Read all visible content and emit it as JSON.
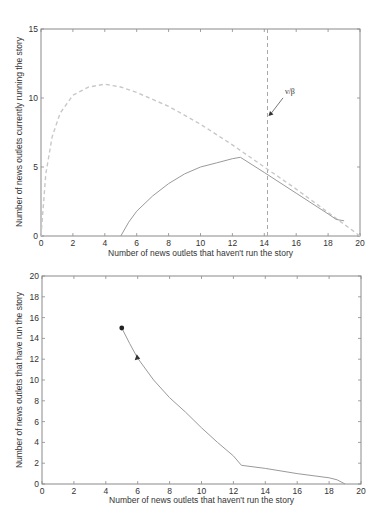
{
  "chart_data": [
    {
      "type": "line",
      "title": "",
      "xlabel": "Number of news outlets that haven't run the story",
      "ylabel": "Number of news outlets currently running the story",
      "xlim": [
        0,
        20
      ],
      "ylim": [
        0,
        15
      ],
      "xticks": [
        "0",
        "2",
        "4",
        "6",
        "8",
        "10",
        "12",
        "14",
        "16",
        "18",
        "20"
      ],
      "yticks": [
        "0",
        "5",
        "10",
        "15"
      ],
      "grid": false,
      "series": [
        {
          "name": "trajectory",
          "style": "solid",
          "x": [
            5.0,
            5.5,
            6.0,
            7.0,
            8.0,
            9.0,
            10.0,
            11.0,
            12.0,
            12.5,
            14.0,
            16.0,
            18.0,
            18.5,
            19.0
          ],
          "y": [
            0.0,
            1.0,
            1.8,
            2.9,
            3.8,
            4.5,
            5.0,
            5.3,
            5.6,
            5.7,
            4.6,
            3.1,
            1.6,
            1.2,
            1.1
          ]
        },
        {
          "name": "nullcline",
          "style": "dashed",
          "x": [
            0.0,
            0.3,
            0.7,
            1.2,
            2.0,
            3.0,
            4.0,
            5.0,
            6.0,
            8.0,
            10.0,
            12.0,
            14.0,
            16.0,
            18.0,
            20.0
          ],
          "y": [
            0.0,
            4.5,
            7.2,
            8.9,
            10.2,
            10.8,
            11.0,
            10.8,
            10.4,
            9.4,
            8.1,
            6.6,
            5.0,
            3.4,
            1.7,
            0.0
          ]
        },
        {
          "name": "nu/beta",
          "style": "dashed-vertical",
          "x": [
            14.2,
            14.2
          ],
          "y": [
            0,
            15
          ]
        }
      ],
      "annotations": [
        {
          "text": "ν/β",
          "arrow_to": [
            14.2,
            8.7
          ],
          "text_at": [
            15.3,
            10.3
          ]
        }
      ]
    },
    {
      "type": "line",
      "title": "",
      "xlabel": "Number of news outlets that haven't run the story",
      "ylabel": "Number of news outlets that have run the story",
      "xlim": [
        0,
        20
      ],
      "ylim": [
        0,
        20
      ],
      "xticks": [
        "0",
        "2",
        "4",
        "6",
        "8",
        "10",
        "12",
        "14",
        "16",
        "18",
        "20"
      ],
      "yticks": [
        "0",
        "2",
        "4",
        "6",
        "8",
        "10",
        "12",
        "14",
        "16",
        "18",
        "20"
      ],
      "grid": false,
      "series": [
        {
          "name": "trajectory",
          "style": "solid",
          "x": [
            5.0,
            5.5,
            6.0,
            7.0,
            8.0,
            9.0,
            10.0,
            11.0,
            12.0,
            12.5,
            14.0,
            16.0,
            18.0,
            18.5,
            19.0
          ],
          "y": [
            15.0,
            13.5,
            12.1,
            10.0,
            8.3,
            6.9,
            5.4,
            4.0,
            2.7,
            1.8,
            1.5,
            1.0,
            0.6,
            0.4,
            0.0
          ]
        }
      ],
      "markers": [
        {
          "name": "start-point",
          "x": 5.0,
          "y": 15.0
        },
        {
          "name": "direction-arrow",
          "x": 6.0,
          "y": 12.1
        }
      ]
    }
  ]
}
